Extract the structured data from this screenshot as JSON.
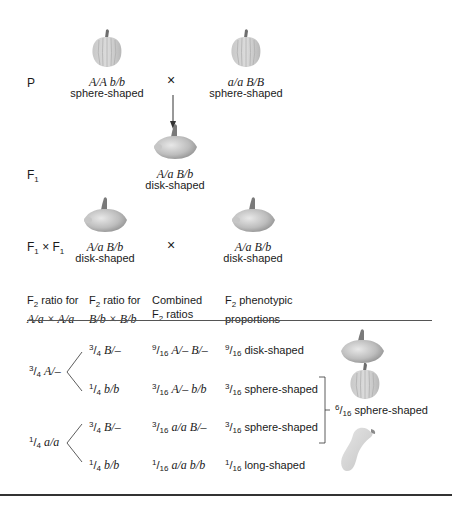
{
  "generations": {
    "p": {
      "label": "P",
      "parent1": {
        "genotype": "A/A  b/b",
        "phenotype": "sphere-shaped",
        "icon": "sphere-squash-icon"
      },
      "parent2": {
        "genotype": "a/a  B/B",
        "phenotype": "sphere-shaped",
        "icon": "sphere-squash-icon"
      },
      "cross_symbol": "×"
    },
    "f1": {
      "label_main": "F",
      "label_sub": "1",
      "genotype": "A/a  B/b",
      "phenotype": "disk-shaped",
      "icon": "disk-squash-icon"
    },
    "f1xf1": {
      "label_f": "F",
      "label_sub": "1",
      "label_x": " × ",
      "parent1": {
        "genotype": "A/a  B/b",
        "phenotype": "disk-shaped"
      },
      "parent2": {
        "genotype": "A/a  B/b",
        "phenotype": "disk-shaped"
      },
      "cross_symbol": "×"
    }
  },
  "table": {
    "headers": [
      {
        "line1_pre": "F",
        "line1_sub": "2",
        "line1_post": " ratio for",
        "line2": "A/a × A/a"
      },
      {
        "line1_pre": "F",
        "line1_sub": "2",
        "line1_post": " ratio for",
        "line2": "B/b × B/b"
      },
      {
        "line1": "Combined",
        "line2_pre": "F",
        "line2_sub": "2",
        "line2_post": " ratios"
      },
      {
        "line1_pre": "F",
        "line1_sub": "2",
        "line1_post": " phenotypic",
        "line2": "proportions"
      }
    ],
    "a_branches": [
      {
        "num": "3",
        "den": "4",
        "genotype": "A/–"
      },
      {
        "num": "1",
        "den": "4",
        "genotype": "a/a"
      }
    ],
    "rows": [
      {
        "b_num": "3",
        "b_den": "4",
        "b_geno": "B/–",
        "c_num": "9",
        "c_den": "16",
        "c_geno": "A/– B/–",
        "p_num": "9",
        "p_den": "16",
        "p_text": "disk-shaped",
        "icon": "disk-squash-icon"
      },
      {
        "b_num": "1",
        "b_den": "4",
        "b_geno": "b/b",
        "c_num": "3",
        "c_den": "16",
        "c_geno": "A/– b/b",
        "p_num": "3",
        "p_den": "16",
        "p_text": "sphere-shaped",
        "icon": "sphere-squash-icon"
      },
      {
        "b_num": "3",
        "b_den": "4",
        "b_geno": "B/–",
        "c_num": "3",
        "c_den": "16",
        "c_geno": "a/a  B/–",
        "p_num": "3",
        "p_den": "16",
        "p_text": "sphere-shaped"
      },
      {
        "b_num": "1",
        "b_den": "4",
        "b_geno": "b/b",
        "c_num": "1",
        "c_den": "16",
        "c_geno": "a/a  b/b",
        "p_num": "1",
        "p_den": "16",
        "p_text": "long-shaped",
        "icon": "long-squash-icon"
      }
    ],
    "combined_sphere": {
      "num": "6",
      "den": "16",
      "text": "sphere-shaped"
    }
  },
  "colors": {
    "squash_light": "#d4d4d4",
    "squash_dark": "#9a9a9a",
    "stem": "#707070",
    "rule": "#444444"
  }
}
